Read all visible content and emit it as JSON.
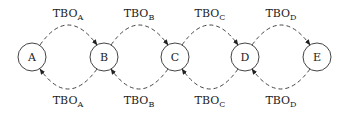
{
  "diagram": {
    "nodes": [
      {
        "id": "A",
        "label": "A"
      },
      {
        "id": "B",
        "label": "B"
      },
      {
        "id": "C",
        "label": "C"
      },
      {
        "id": "D",
        "label": "D"
      },
      {
        "id": "E",
        "label": "E"
      }
    ],
    "edges_top": [
      {
        "from": "A",
        "to": "B",
        "label": "TBO",
        "sub": "A"
      },
      {
        "from": "B",
        "to": "C",
        "label": "TBO",
        "sub": "B"
      },
      {
        "from": "C",
        "to": "D",
        "label": "TBO",
        "sub": "C"
      },
      {
        "from": "D",
        "to": "E",
        "label": "TBO",
        "sub": "D"
      }
    ],
    "edges_bottom": [
      {
        "from": "B",
        "to": "A",
        "label": "TBO",
        "sub": "A"
      },
      {
        "from": "C",
        "to": "B",
        "label": "TBO",
        "sub": "B"
      },
      {
        "from": "D",
        "to": "C",
        "label": "TBO",
        "sub": "C"
      },
      {
        "from": "E",
        "to": "D",
        "label": "TBO",
        "sub": "D"
      }
    ]
  }
}
